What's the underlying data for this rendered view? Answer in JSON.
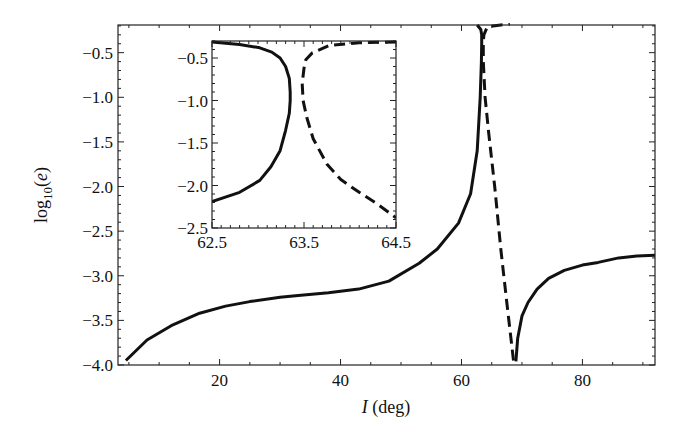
{
  "chart_data": [
    {
      "id": "main",
      "type": "line",
      "title": "",
      "xlabel_italic": "I",
      "xlabel_rest": " (deg)",
      "xlabel": "I (deg)",
      "ylabel": "log10(e)",
      "ylabel_base": "log",
      "ylabel_sub": "10",
      "ylabel_arg": "(e)",
      "xlim": [
        3.2,
        92
      ],
      "ylim": [
        -4.0,
        -0.19
      ],
      "xticks": [
        20,
        40,
        60,
        80
      ],
      "xtick_labels": [
        "20",
        "40",
        "60",
        "80"
      ],
      "yticks": [
        -0.5,
        -1.0,
        -1.5,
        -2.0,
        -2.5,
        -3.0,
        -3.5,
        -4.0
      ],
      "ytick_labels": [
        "-0.5",
        "-1.0",
        "-1.5",
        "-2.0",
        "-2.5",
        "-3.0",
        "-3.5",
        "-4.0"
      ],
      "xminor_step": 5,
      "yminor_step": 0.1,
      "grid": false,
      "legend": null,
      "series": [
        {
          "name": "solid-left-branch",
          "style": "solid",
          "x": [
            4.5,
            8,
            12,
            16.7,
            21,
            25,
            30,
            33,
            38,
            43,
            48,
            53,
            56,
            59.5,
            61.5,
            62.6,
            63.1,
            63.3,
            63.35,
            63.35,
            63.2,
            62.6
          ],
          "y": [
            -3.95,
            -3.72,
            -3.56,
            -3.42,
            -3.34,
            -3.29,
            -3.24,
            -3.22,
            -3.19,
            -3.15,
            -3.06,
            -2.86,
            -2.7,
            -2.41,
            -2.08,
            -1.6,
            -1.0,
            -0.6,
            -0.4,
            -0.3,
            -0.24,
            -0.19
          ]
        },
        {
          "name": "dashed-branch",
          "style": "dashed",
          "x": [
            68.6,
            67.5,
            66.5,
            65.5,
            64.5,
            63.9,
            63.6,
            63.6,
            63.7,
            64.2,
            65.2,
            66.5,
            68.0
          ],
          "y": [
            -3.95,
            -3.3,
            -2.7,
            -2.0,
            -1.4,
            -1.0,
            -0.6,
            -0.38,
            -0.3,
            -0.22,
            -0.2,
            -0.19,
            -0.18
          ]
        },
        {
          "name": "solid-right-branch",
          "style": "solid",
          "x": [
            69.0,
            69.3,
            70,
            71,
            72.5,
            74.4,
            77,
            80,
            82.6,
            86,
            89,
            92
          ],
          "y": [
            -3.96,
            -3.7,
            -3.45,
            -3.3,
            -3.15,
            -3.03,
            -2.94,
            -2.88,
            -2.85,
            -2.8,
            -2.78,
            -2.77
          ]
        }
      ]
    },
    {
      "id": "inset",
      "type": "line",
      "title": "",
      "xlabel": "",
      "ylabel": "",
      "xlim": [
        62.5,
        64.5
      ],
      "ylim": [
        -2.5,
        -0.3
      ],
      "xticks": [
        62.5,
        63.5,
        64.5
      ],
      "xtick_labels": [
        "62.5",
        "63.5",
        "64.5"
      ],
      "yticks": [
        -0.5,
        -1.0,
        -1.5,
        -2.0,
        -2.5
      ],
      "ytick_labels": [
        "-0.5",
        "-1.0",
        "-1.5",
        "-2.0",
        "-2.5"
      ],
      "xminor_step": 0.1,
      "yminor_step": 0.1,
      "grid": false,
      "legend": null,
      "series": [
        {
          "name": "solid-branch-zoom",
          "style": "solid",
          "x": [
            62.5,
            62.8,
            63.02,
            63.15,
            63.24,
            63.3,
            63.34,
            63.35,
            63.35,
            63.34,
            63.3,
            63.24,
            63.14,
            63.02,
            62.8,
            62.5
          ],
          "y": [
            -0.31,
            -0.34,
            -0.38,
            -0.43,
            -0.5,
            -0.6,
            -0.74,
            -0.9,
            -1.0,
            -1.15,
            -1.35,
            -1.59,
            -1.78,
            -1.94,
            -2.08,
            -2.19
          ]
        },
        {
          "name": "dashed-branch-zoom",
          "style": "dashed",
          "x": [
            64.5,
            64.1,
            63.78,
            63.59,
            63.52,
            63.5,
            63.48,
            63.49,
            63.53,
            63.6,
            63.75,
            63.9,
            64.1,
            64.3,
            64.5
          ],
          "y": [
            -0.31,
            -0.32,
            -0.35,
            -0.44,
            -0.52,
            -0.62,
            -0.8,
            -1.0,
            -1.2,
            -1.45,
            -1.75,
            -1.93,
            -2.08,
            -2.22,
            -2.38
          ]
        }
      ]
    }
  ],
  "layout_px": {
    "main": {
      "left": 118,
      "top": 25,
      "right": 655,
      "bottom": 365
    },
    "inset": {
      "left": 212,
      "top": 41,
      "right": 396,
      "bottom": 228
    }
  },
  "colors": {
    "line": "#111111",
    "axes": "#222222",
    "background": "#ffffff"
  }
}
